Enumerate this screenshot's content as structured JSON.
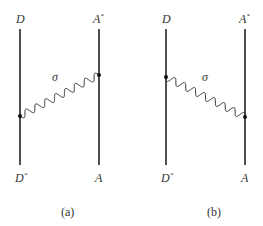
{
  "panels": [
    {
      "caption": "(a)",
      "top_left": "D",
      "top_right": "A",
      "top_right_sup": "*",
      "bottom_left": "D",
      "bottom_left_sup": "*",
      "bottom_right": "A",
      "interaction": "σ",
      "direction": "D*→A*"
    },
    {
      "caption": "(b)",
      "top_left": "D",
      "top_right": "A",
      "top_right_sup": "*",
      "bottom_left": "D",
      "bottom_left_sup": "*",
      "bottom_right": "A",
      "interaction": "σ",
      "direction": "D→A"
    }
  ]
}
